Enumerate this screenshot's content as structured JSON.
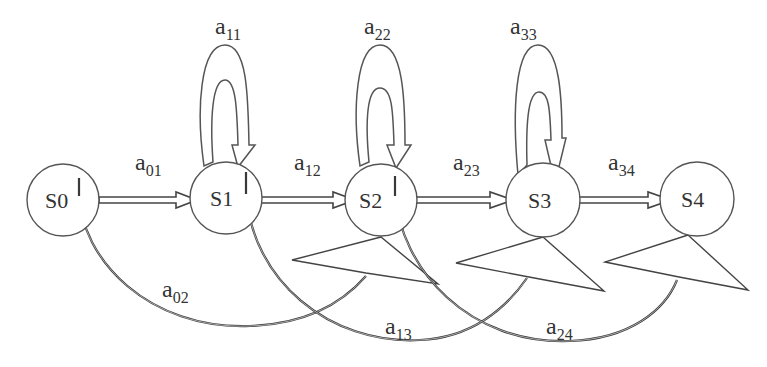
{
  "diagram": {
    "type": "left-to-right HMM state transition diagram",
    "states": [
      {
        "id": "S0",
        "label": "S0",
        "cx": 63,
        "cy": 200,
        "r": 36
      },
      {
        "id": "S1",
        "label": "S1",
        "cx": 226,
        "cy": 198,
        "r": 36
      },
      {
        "id": "S2",
        "label": "S2",
        "cx": 381,
        "cy": 200,
        "r": 36
      },
      {
        "id": "S3",
        "label": "S3",
        "cx": 543,
        "cy": 200,
        "r": 37
      },
      {
        "id": "S4",
        "label": "S4",
        "cx": 697,
        "cy": 199,
        "r": 37
      }
    ],
    "forward_transitions": [
      {
        "from": "S0",
        "to": "S1",
        "label_main": "a",
        "label_sub": "01"
      },
      {
        "from": "S1",
        "to": "S2",
        "label_main": "a",
        "label_sub": "12"
      },
      {
        "from": "S2",
        "to": "S3",
        "label_main": "a",
        "label_sub": "23"
      },
      {
        "from": "S3",
        "to": "S4",
        "label_main": "a",
        "label_sub": "34"
      }
    ],
    "self_loops": [
      {
        "state": "S1",
        "label_main": "a",
        "label_sub": "11"
      },
      {
        "state": "S2",
        "label_main": "a",
        "label_sub": "22"
      },
      {
        "state": "S3",
        "label_main": "a",
        "label_sub": "33"
      }
    ],
    "skip_transitions": [
      {
        "from": "S0",
        "to": "S2",
        "label_main": "a",
        "label_sub": "02"
      },
      {
        "from": "S1",
        "to": "S3",
        "label_main": "a",
        "label_sub": "13"
      },
      {
        "from": "S2",
        "to": "S4",
        "label_main": "a",
        "label_sub": "24"
      }
    ],
    "colors": {
      "background": "#ffffff",
      "stroke": "#444444",
      "text": "#333333"
    }
  }
}
